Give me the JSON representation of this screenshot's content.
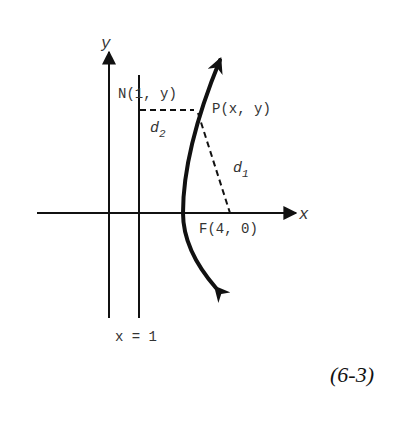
{
  "diagram": {
    "axes": {
      "x_label": "x",
      "y_label": "y"
    },
    "directrix": {
      "label": "x = 1"
    },
    "points": {
      "N": "N(1, y)",
      "P": "P(x, y)",
      "F": "F(4, 0)"
    },
    "distances": {
      "d1": {
        "base": "d",
        "sub": "1"
      },
      "d2": {
        "base": "d",
        "sub": "2"
      }
    },
    "equation_tag": "(6-3)",
    "colors": {
      "ink": "#111111",
      "text": "#333333",
      "background": "#ffffff"
    }
  }
}
